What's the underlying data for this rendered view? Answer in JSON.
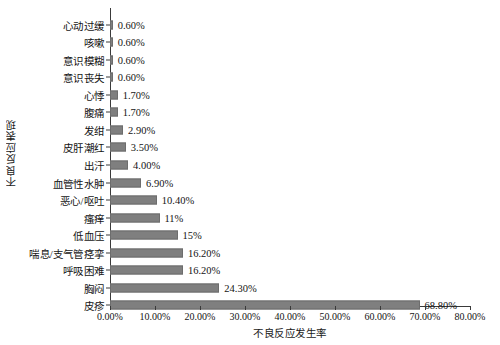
{
  "chart_data": {
    "type": "bar",
    "orientation": "horizontal",
    "title": "",
    "xlabel": "不良反应发生率",
    "ylabel": "不良反应表现",
    "xlim": [
      0,
      80
    ],
    "xtick_labels": [
      "0.00%",
      "10.00%",
      "20.00%",
      "30.00%",
      "40.00%",
      "50.00%",
      "60.00%",
      "70.00%",
      "80.00%"
    ],
    "xtick_values": [
      0,
      10,
      20,
      30,
      40,
      50,
      60,
      70,
      80
    ],
    "grid": false,
    "legend": null,
    "bar_color": "#7f7f7f",
    "categories": [
      "心动过缓",
      "咳嗽",
      "意识模糊",
      "意识丧失",
      "心悸",
      "腹痛",
      "发绀",
      "皮肝潮红",
      "出汗",
      "血管性水肿",
      "恶心/呕吐",
      "瘙痒",
      "低血压",
      "喘息/支气管痉挛",
      "呼吸困难",
      "胸闷",
      "皮疹"
    ],
    "values": [
      0.6,
      0.6,
      0.6,
      0.6,
      1.7,
      1.7,
      2.9,
      3.5,
      4.0,
      6.9,
      10.4,
      11.0,
      15.0,
      16.2,
      16.2,
      24.3,
      68.8
    ],
    "data_labels": [
      "0.60%",
      "0.60%",
      "0.60%",
      "0.60%",
      "1.70%",
      "1.70%",
      "2.90%",
      "3.50%",
      "4.00%",
      "6.90%",
      "10.40%",
      "11%",
      "15%",
      "16.20%",
      "16.20%",
      "24.30%",
      "68.80%"
    ]
  }
}
